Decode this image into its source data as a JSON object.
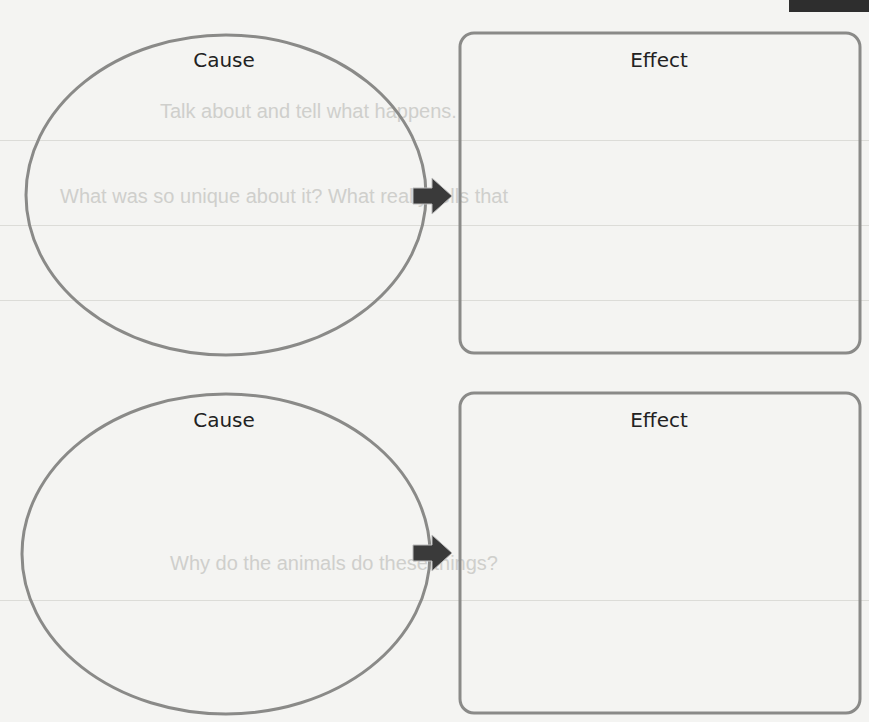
{
  "diagram": {
    "type": "cause-effect worksheet",
    "pairs": [
      {
        "cause": {
          "label": "Cause",
          "shape": "ellipse"
        },
        "arrow": "right-arrow",
        "effect": {
          "label": "Effect",
          "shape": "rounded-rectangle"
        }
      },
      {
        "cause": {
          "label": "Cause",
          "shape": "ellipse"
        },
        "arrow": "right-arrow",
        "effect": {
          "label": "Effect",
          "shape": "rounded-rectangle"
        }
      }
    ]
  },
  "bleed_through_text": {
    "line1": "Talk about and tell what happens.",
    "line2": "What was so unique about it?          What really tells that",
    "line3": "Why do the animals do these things?"
  },
  "colors": {
    "outline": "#8a8a88",
    "arrow": "#3a3a3a",
    "background": "#f4f4f2"
  }
}
